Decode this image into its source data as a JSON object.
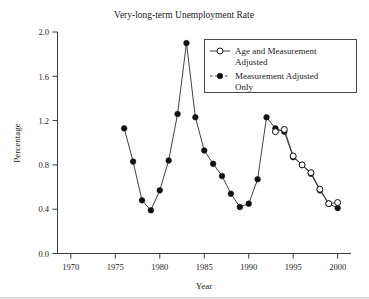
{
  "chart_data": {
    "type": "line",
    "title": "Very-long-term Unemployment Rate",
    "xlabel": "Year",
    "ylabel": "Percentage",
    "xlim": [
      1968.5,
      2001.5
    ],
    "ylim": [
      0.0,
      2.0
    ],
    "xticks": [
      1970,
      1975,
      1980,
      1985,
      1990,
      1995,
      2000
    ],
    "xtick_labels": [
      "1970",
      "1975",
      "1980",
      "1985",
      "1990",
      "1995",
      "2000"
    ],
    "yticks": [
      0.0,
      0.4,
      0.8,
      1.2,
      1.6,
      2.0
    ],
    "ytick_labels": [
      "0.0",
      "0.4",
      "0.8",
      "1.2",
      "1.6",
      "2.0"
    ],
    "grid": false,
    "legend_position": "top-right",
    "series": [
      {
        "name": "Age and Measurement Adjusted",
        "marker": "open-circle",
        "linestyle": "solid",
        "x": [
          1993,
          1994,
          1995,
          1996,
          1997,
          1998,
          1999,
          2000
        ],
        "values": [
          1.1,
          1.12,
          0.88,
          0.8,
          0.73,
          0.58,
          0.45,
          0.46
        ]
      },
      {
        "name": "Measurement Adjusted Only",
        "marker": "filled-circle",
        "linestyle": "dashed",
        "x": [
          1976,
          1977,
          1978,
          1979,
          1980,
          1981,
          1982,
          1983,
          1984,
          1985,
          1986,
          1987,
          1988,
          1989,
          1990,
          1991,
          1992,
          1993,
          1994,
          1995,
          1996,
          1997,
          1998,
          1999,
          2000
        ],
        "values": [
          1.13,
          0.83,
          0.48,
          0.39,
          0.57,
          0.84,
          1.26,
          1.9,
          1.23,
          0.93,
          0.81,
          0.7,
          0.54,
          0.42,
          0.45,
          0.67,
          1.23,
          1.13,
          1.1,
          0.87,
          0.8,
          0.72,
          0.57,
          0.45,
          0.41
        ]
      }
    ]
  },
  "legend": {
    "entries": [
      {
        "label_line1": "Age and Measurement",
        "label_line2": "Adjusted"
      },
      {
        "label_line1": "Measurement Adjusted",
        "label_line2": "Only"
      }
    ]
  },
  "colors": {
    "line": "#2b2b2b",
    "marker_fill": "#111111",
    "marker_open_fill": "#ffffff",
    "axis": "#3a3a3a",
    "text": "#1a1a1a",
    "background": "#ffffff"
  }
}
